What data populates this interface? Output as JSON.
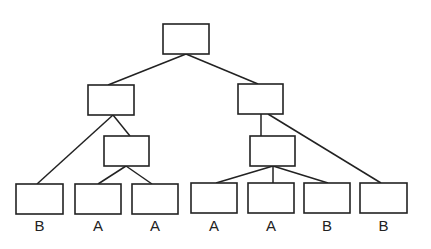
{
  "diagram": {
    "type": "tree",
    "line_color": "#222222",
    "background": "#ffffff",
    "nodes": [
      {
        "id": "root",
        "x": 163,
        "y": 24,
        "w": 46,
        "h": 30,
        "label": ""
      },
      {
        "id": "L",
        "x": 88,
        "y": 85,
        "w": 46,
        "h": 30,
        "label": ""
      },
      {
        "id": "R",
        "x": 238,
        "y": 84,
        "w": 45,
        "h": 30,
        "label": ""
      },
      {
        "id": "LM",
        "x": 104,
        "y": 136,
        "w": 45,
        "h": 30,
        "label": ""
      },
      {
        "id": "RM",
        "x": 250,
        "y": 136,
        "w": 45,
        "h": 30,
        "label": ""
      },
      {
        "id": "leaf1",
        "x": 16,
        "y": 184,
        "w": 47,
        "h": 30,
        "label": "B"
      },
      {
        "id": "leaf2",
        "x": 75,
        "y": 184,
        "w": 46,
        "h": 30,
        "label": "A"
      },
      {
        "id": "leaf3",
        "x": 132,
        "y": 184,
        "w": 46,
        "h": 30,
        "label": "A"
      },
      {
        "id": "leaf4",
        "x": 191,
        "y": 183,
        "w": 46,
        "h": 30,
        "label": "A"
      },
      {
        "id": "leaf5",
        "x": 248,
        "y": 183,
        "w": 46,
        "h": 30,
        "label": "A"
      },
      {
        "id": "leaf6",
        "x": 304,
        "y": 183,
        "w": 46,
        "h": 30,
        "label": "B"
      },
      {
        "id": "leaf7",
        "x": 360,
        "y": 183,
        "w": 47,
        "h": 30,
        "label": "B"
      }
    ],
    "edges": [
      {
        "from": "root",
        "to": "L",
        "x1": 186,
        "y1": 54,
        "x2": 108,
        "y2": 85
      },
      {
        "from": "root",
        "to": "R",
        "x1": 186,
        "y1": 54,
        "x2": 258,
        "y2": 84
      },
      {
        "from": "L",
        "to": "leaf1",
        "x1": 113,
        "y1": 115,
        "x2": 37,
        "y2": 184
      },
      {
        "from": "L",
        "to": "LM",
        "x1": 113,
        "y1": 115,
        "x2": 130,
        "y2": 136
      },
      {
        "from": "LM",
        "to": "leaf2",
        "x1": 126,
        "y1": 166,
        "x2": 98,
        "y2": 184
      },
      {
        "from": "LM",
        "to": "leaf3",
        "x1": 126,
        "y1": 166,
        "x2": 152,
        "y2": 184
      },
      {
        "from": "R",
        "to": "RM",
        "x1": 261,
        "y1": 114,
        "x2": 261,
        "y2": 136
      },
      {
        "from": "R",
        "to": "leaf7",
        "x1": 268,
        "y1": 114,
        "x2": 381,
        "y2": 183
      },
      {
        "from": "RM",
        "to": "leaf4",
        "x1": 273,
        "y1": 166,
        "x2": 216,
        "y2": 183
      },
      {
        "from": "RM",
        "to": "leaf5",
        "x1": 273,
        "y1": 166,
        "x2": 273,
        "y2": 183
      },
      {
        "from": "RM",
        "to": "leaf6",
        "x1": 273,
        "y1": 166,
        "x2": 328,
        "y2": 183
      }
    ],
    "leaf_labels": [
      "B",
      "A",
      "A",
      "A",
      "A",
      "B",
      "B"
    ],
    "label_y": 231
  }
}
